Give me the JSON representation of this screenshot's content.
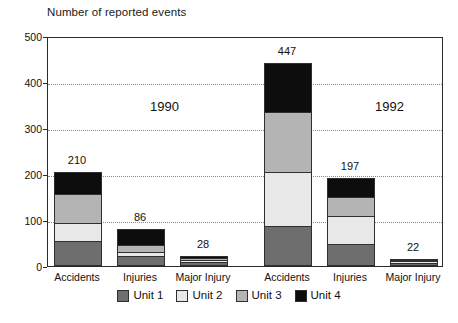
{
  "chart_data": {
    "type": "bar",
    "title": "Number of reported events",
    "xlabel": "",
    "ylabel": "",
    "ylim": [
      0,
      500
    ],
    "yticks": [
      0,
      100,
      200,
      300,
      400,
      500
    ],
    "grid": true,
    "stacked": true,
    "legend_position": "bottom",
    "groups": [
      {
        "name": "1990",
        "categories": [
          "Accidents",
          "Injuries",
          "Major Injury"
        ],
        "totals": [
          210,
          86,
          28
        ]
      },
      {
        "name": "1992",
        "categories": [
          "Accidents",
          "Injuries",
          "Major Injury"
        ],
        "totals": [
          447,
          197,
          22
        ]
      }
    ],
    "categories": [
      "Accidents",
      "Injuries",
      "Major Injury",
      "Accidents",
      "Injuries",
      "Major Injury"
    ],
    "series": [
      {
        "name": "Unit 1",
        "color": "#6e6e6e",
        "values": [
          55,
          22,
          9,
          88,
          48,
          7
        ]
      },
      {
        "name": "Unit 2",
        "color": "#e8e8e8",
        "values": [
          40,
          10,
          7,
          119,
          62,
          6
        ]
      },
      {
        "name": "Unit 3",
        "color": "#b4b4b4",
        "values": [
          65,
          18,
          6,
          133,
          45,
          5
        ]
      },
      {
        "name": "Unit 4",
        "color": "#0d0d0d",
        "values": [
          50,
          36,
          6,
          107,
          42,
          4
        ]
      }
    ],
    "bar_labels": [
      "210",
      "86",
      "28",
      "447",
      "197",
      "22"
    ],
    "annotations": [
      {
        "text": "1990",
        "value": "1990"
      },
      {
        "text": "1992",
        "value": "1992"
      }
    ]
  },
  "legend": {
    "items": [
      {
        "label": "Unit 1",
        "color": "#6e6e6e"
      },
      {
        "label": "Unit 2",
        "color": "#e8e8e8"
      },
      {
        "label": "Unit 3",
        "color": "#b4b4b4"
      },
      {
        "label": "Unit 4",
        "color": "#0d0d0d"
      }
    ]
  },
  "axis": {
    "y_labels": [
      "500",
      "400",
      "300",
      "200",
      "100",
      "0"
    ]
  }
}
